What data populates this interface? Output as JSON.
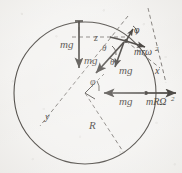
{
  "figure": {
    "kind": "free-body-diagram",
    "caption_present": false,
    "background_color": "#f4f3f1",
    "ink_color": "#2b2723",
    "width": 182,
    "height": 173
  },
  "geometry": {
    "circle": {
      "cx": 85,
      "cy": 93,
      "r": 71,
      "label": "bead-path-circle"
    },
    "center_label": "circle-center",
    "particle_point": {
      "x": 126,
      "y": 41
    }
  },
  "axes": [
    {
      "name": "z",
      "label": "z",
      "x": 97,
      "y": 39,
      "orientation": "horizontal-dashed"
    },
    {
      "name": "x",
      "label": "x",
      "x": 157,
      "y": 71,
      "orientation": "diagonal-dashed"
    },
    {
      "name": "y",
      "label": "y",
      "x": 48,
      "y": 117,
      "orientation": "diagonal-dashed"
    }
  ],
  "angles": [
    {
      "name": "phi-top",
      "label": "φ",
      "x": 136,
      "y": 32
    },
    {
      "name": "theta-upper",
      "label": "θ",
      "x": 105,
      "y": 48
    },
    {
      "name": "theta-lower",
      "label": "θ",
      "x": 112,
      "y": 62
    },
    {
      "name": "phi-center",
      "label": "φ",
      "x": 93,
      "y": 82
    }
  ],
  "vectors": [
    {
      "name": "mg-vertical-top",
      "label": "mg",
      "label_x": 66,
      "label_y": 45,
      "from": {
        "x": 79,
        "y": 21
      },
      "to": {
        "x": 79,
        "y": 68
      },
      "direction": "down"
    },
    {
      "name": "mg-slanted-left",
      "label": "mg",
      "label_x": 88,
      "label_y": 61,
      "from": {
        "x": 124,
        "y": 42
      },
      "to": {
        "x": 96,
        "y": 72
      },
      "direction": "down-left"
    },
    {
      "name": "mg-component-vertical",
      "label": "mg",
      "label_x": 122,
      "label_y": 72,
      "from": {
        "x": 124,
        "y": 42
      },
      "to": {
        "x": 114,
        "y": 66
      },
      "direction": "down"
    },
    {
      "name": "mromega-squared",
      "label": "mrω",
      "exponent": "2",
      "label_x": 138,
      "label_y": 52,
      "from": {
        "x": 126,
        "y": 41
      },
      "to": {
        "x": 143,
        "y": 46
      },
      "direction": "outward-right"
    },
    {
      "name": "mg-horizontal-center",
      "label": "mg",
      "label_x": 124,
      "label_y": 102,
      "from": {
        "x": 143,
        "y": 93
      },
      "to": {
        "x": 105,
        "y": 93
      },
      "direction": "left"
    },
    {
      "name": "mRomega-squared",
      "label": "mRΩ",
      "exponent": "2",
      "label_x": 152,
      "label_y": 103,
      "from": {
        "x": 147,
        "y": 93
      },
      "to": {
        "x": 175,
        "y": 93
      },
      "direction": "right"
    }
  ],
  "radius": {
    "name": "radius-R",
    "label": "R",
    "label_x": 93,
    "label_y": 126,
    "from": {
      "x": 85,
      "y": 93
    },
    "to": {
      "x": 120,
      "y": 150
    }
  }
}
